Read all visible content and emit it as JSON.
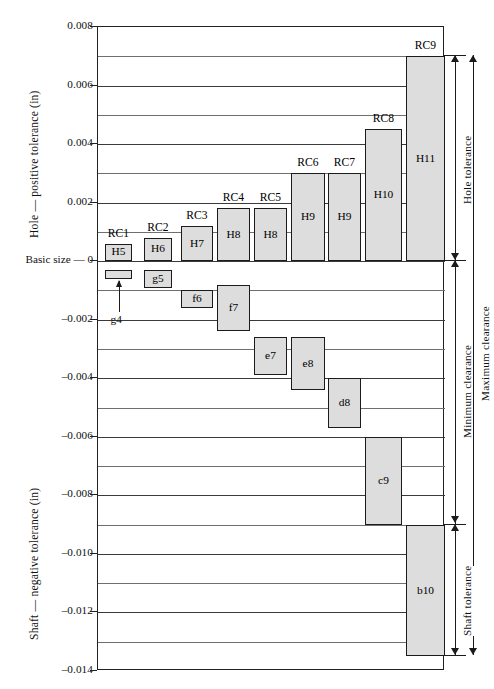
{
  "chart_data": {
    "type": "bar",
    "title": "",
    "ylabel_upper": "Hole — positive tolerance (in)",
    "ylabel_lower": "Shaft — negative tolerance (in)",
    "xlabel": "",
    "grid": true,
    "ylim": [
      -0.014,
      0.008
    ],
    "y_major_ticks": [
      0.008,
      0.006,
      0.004,
      0.002,
      0,
      -0.002,
      -0.004,
      -0.006,
      -0.008,
      -0.01,
      -0.012,
      -0.014
    ],
    "y_major_tick_labels": [
      "0.008",
      "0.006",
      "0.004",
      "0.002",
      "0",
      "–0.002",
      "–0.004",
      "–0.006",
      "–0.008",
      "–0.010",
      "–0.012",
      "–0.014"
    ],
    "y_minor_ticks": [
      0.007,
      0.005,
      0.003,
      0.001,
      -0.001,
      -0.003,
      -0.005,
      -0.007,
      -0.009,
      -0.011,
      -0.013
    ],
    "zero_label": "Basic size — 0",
    "fit_classes": [
      "RC1",
      "RC2",
      "RC3",
      "RC4",
      "RC5",
      "RC6",
      "RC7",
      "RC8",
      "RC9"
    ],
    "hole_bars": [
      {
        "class": "RC1",
        "label": "H5",
        "low": 0.0,
        "high": 0.0006
      },
      {
        "class": "RC2",
        "label": "H6",
        "low": 0.0,
        "high": 0.0008
      },
      {
        "class": "RC3",
        "label": "H7",
        "low": 0.0,
        "high": 0.0012
      },
      {
        "class": "RC4",
        "label": "H8",
        "low": 0.0,
        "high": 0.0018
      },
      {
        "class": "RC5",
        "label": "H8",
        "low": 0.0,
        "high": 0.0018
      },
      {
        "class": "RC6",
        "label": "H9",
        "low": 0.0,
        "high": 0.003
      },
      {
        "class": "RC7",
        "label": "H9",
        "low": 0.0,
        "high": 0.003
      },
      {
        "class": "RC8",
        "label": "H10",
        "low": 0.0,
        "high": 0.0045
      },
      {
        "class": "RC9",
        "label": "H11",
        "low": 0.0,
        "high": 0.007
      }
    ],
    "shaft_bars": [
      {
        "class": "RC1",
        "label": "g4",
        "low": -0.0006,
        "high": -0.0003
      },
      {
        "class": "RC2",
        "label": "g5",
        "low": -0.0009,
        "high": -0.0003
      },
      {
        "class": "RC3",
        "label": "f6",
        "low": -0.0016,
        "high": -0.001
      },
      {
        "class": "RC4",
        "label": "f7",
        "low": -0.0024,
        "high": -0.0008
      },
      {
        "class": "RC5",
        "label": "e7",
        "low": -0.0039,
        "high": -0.0026
      },
      {
        "class": "RC6",
        "label": "e8",
        "low": -0.0044,
        "high": -0.0026
      },
      {
        "class": "RC7",
        "label": "d8",
        "low": -0.0057,
        "high": -0.004
      },
      {
        "class": "RC8",
        "label": "c9",
        "low": -0.009,
        "high": -0.006
      },
      {
        "class": "RC9",
        "label": "b10",
        "low": -0.0135,
        "high": -0.009
      }
    ],
    "annotations": [
      {
        "name": "hole-tolerance",
        "label": "Hole tolerance",
        "from": 0.007,
        "to": 0.0
      },
      {
        "name": "minimum-clearance",
        "label": "Minimum clearance",
        "from": 0.0,
        "to": -0.009
      },
      {
        "name": "maximum-clearance",
        "label": "Maximum clearance",
        "from": 0.007,
        "to": -0.0135
      },
      {
        "name": "shaft-tolerance",
        "label": "Shaft tolerance",
        "from": -0.009,
        "to": -0.0135
      }
    ],
    "colors": {
      "bar_fill": "#dddddd",
      "bar_stroke": "#1b1b1b",
      "grid": "#6f6f6f",
      "frame": "#222222",
      "text": "#111111"
    }
  }
}
